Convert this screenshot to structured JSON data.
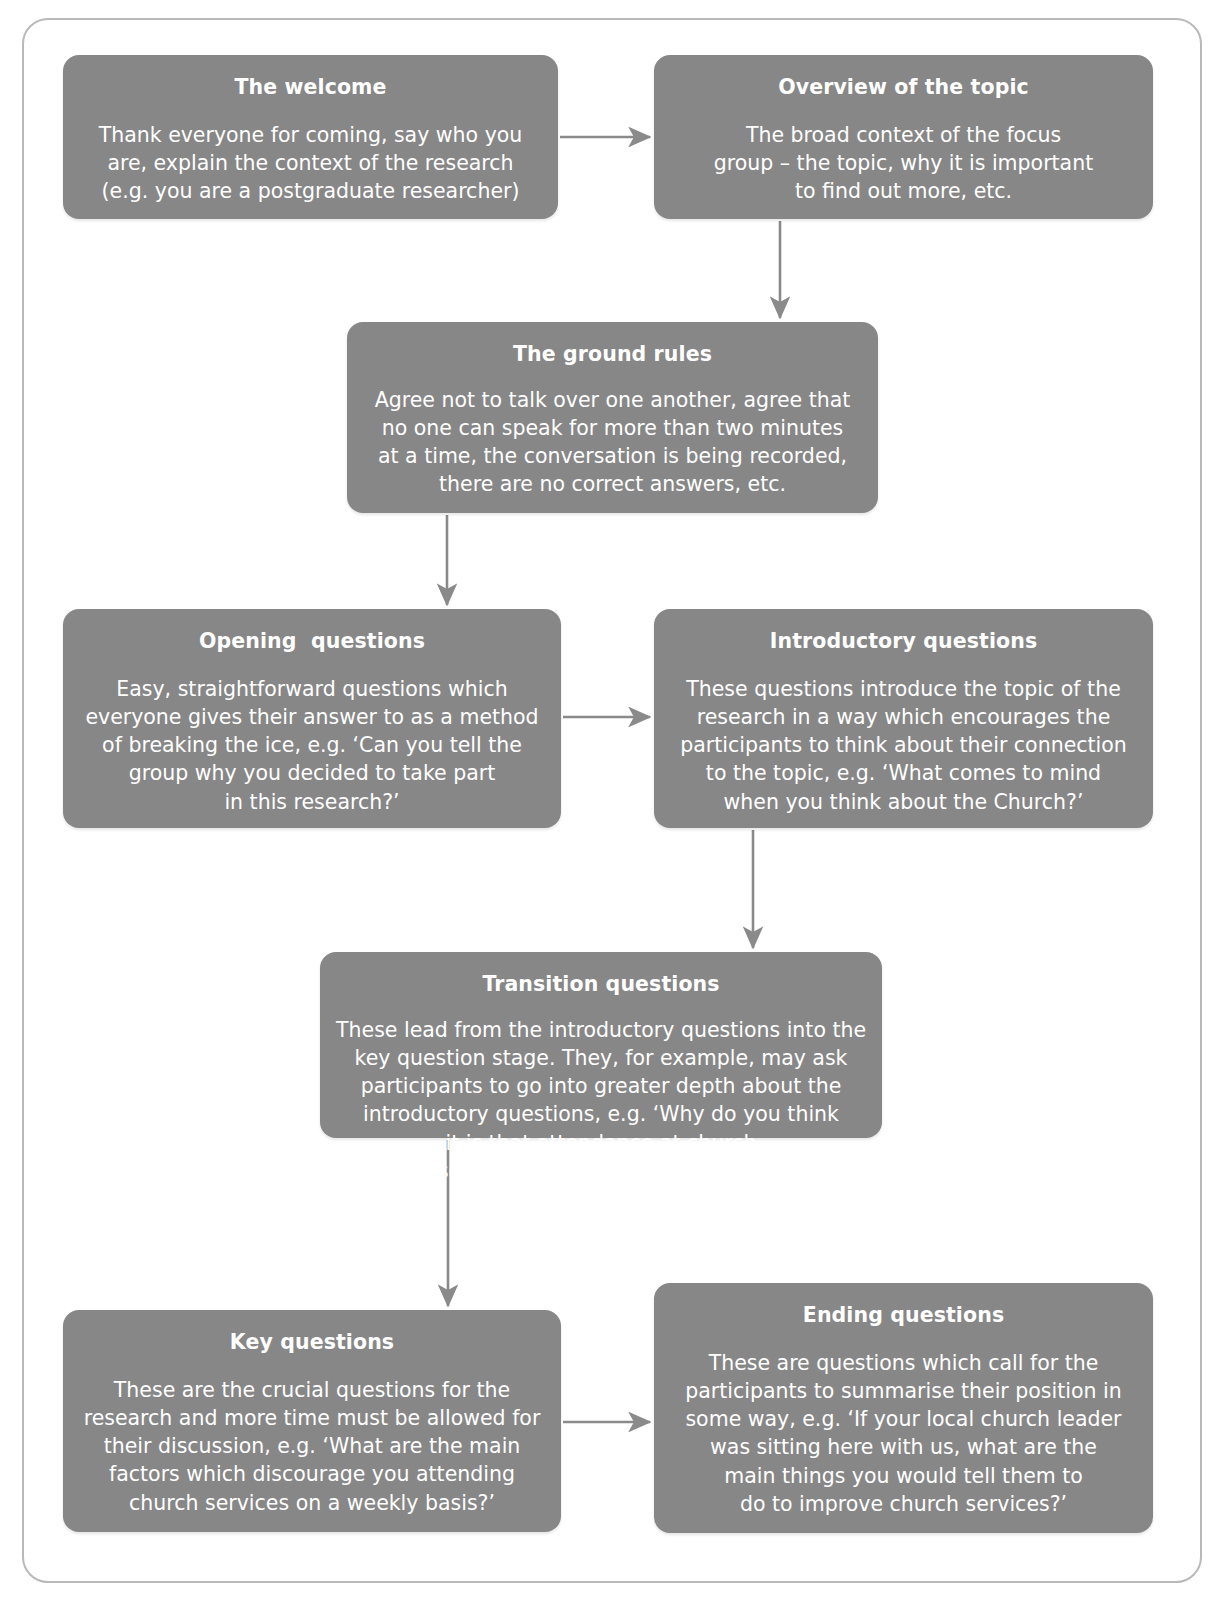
{
  "diagram": {
    "type": "flowchart",
    "orientation": "top-to-bottom zig-zag",
    "node_fill": "#878787",
    "node_text_color": "#ffffff",
    "connector_color": "#8a8a8a",
    "frame_border_color": "#b9b9b9",
    "background": "#ffffff"
  },
  "nodes": [
    {
      "id": "welcome",
      "title": "The welcome",
      "lines": [
        "Thank everyone for coming, say who you",
        "are, explain the context of the research",
        "(e.g. you are a postgraduate researcher)"
      ]
    },
    {
      "id": "overview",
      "title": "Overview of the topic",
      "lines": [
        "The broad context of the focus",
        "group – the topic, why it is important",
        "to find out more, etc."
      ]
    },
    {
      "id": "ground",
      "title": "The ground rules",
      "lines": [
        "Agree not to talk over one another, agree that",
        "no one can speak for more than two minutes",
        "at a time, the conversation is being recorded,",
        "there are no correct answers, etc."
      ]
    },
    {
      "id": "opening",
      "title": "Opening  questions",
      "lines": [
        "Easy, straightforward questions which",
        "everyone gives their answer to as a method",
        "of breaking the ice, e.g. ‘Can you tell the",
        "group why you decided to take part",
        "in this research?’"
      ]
    },
    {
      "id": "introductory",
      "title": "Introductory questions",
      "lines": [
        "These questions introduce the topic of the",
        "research in a way which encourages the",
        "participants to think about their connection",
        "to the topic, e.g. ‘What comes to mind",
        "when you think about the Church?’"
      ]
    },
    {
      "id": "transition",
      "title": "Transition questions",
      "lines": [
        "These lead from the introductory questions into the",
        "key question stage. They, for example, may ask",
        "participants to go into greater depth about the",
        "introductory questions, e.g. ‘Why do you think",
        "it is that attendance at church",
        "services is generally declining?’"
      ]
    },
    {
      "id": "key",
      "title": "Key questions",
      "lines": [
        "These are the crucial questions for the",
        "research and more time must be allowed for",
        "their discussion, e.g. ‘What are the main",
        "factors which discourage you attending",
        "church services on a weekly basis?’"
      ]
    },
    {
      "id": "ending",
      "title": "Ending questions",
      "lines": [
        "These are questions which call for the",
        "participants to summarise their position in",
        "some way, e.g. ‘If your local church leader",
        "was sitting here with us, what are the",
        "main things you would tell them to",
        "do to improve church services?’"
      ]
    }
  ],
  "edges": [
    {
      "from": "welcome",
      "to": "overview",
      "direction": "right"
    },
    {
      "from": "overview",
      "to": "ground",
      "direction": "down"
    },
    {
      "from": "ground",
      "to": "opening",
      "direction": "down"
    },
    {
      "from": "opening",
      "to": "introductory",
      "direction": "right"
    },
    {
      "from": "introductory",
      "to": "transition",
      "direction": "down"
    },
    {
      "from": "transition",
      "to": "key",
      "direction": "down"
    },
    {
      "from": "key",
      "to": "ending",
      "direction": "right"
    }
  ]
}
